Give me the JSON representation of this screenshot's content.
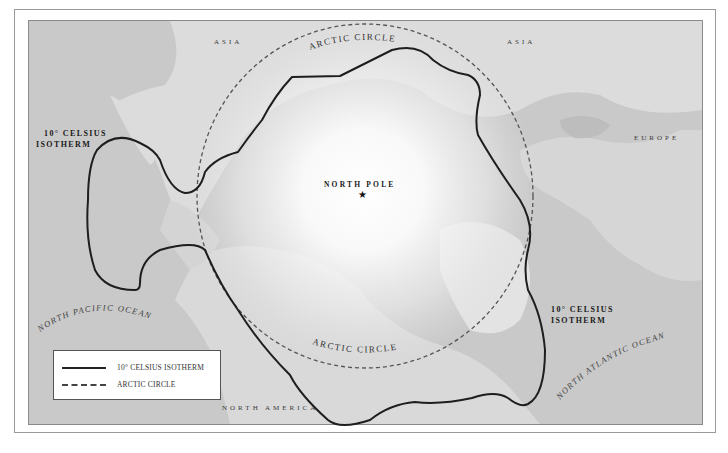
{
  "map": {
    "title": "",
    "colors": {
      "ocean": "#c9c9c9",
      "land": "#dedede",
      "pole_glow": "#ffffff",
      "isotherm_line": "#1e1e1e",
      "arctic_circle_line": "#555555",
      "frame_border": "#9a9a9a"
    },
    "center_marker": {
      "label": "NORTH POLE",
      "icon": "star-icon",
      "glyph": "★"
    },
    "regions": {
      "asia_left": "ASIA",
      "asia_right": "ASIA",
      "europe": "EUROPE",
      "north_america": "NORTH AMERICA"
    },
    "oceans": {
      "north_pacific": "NORTH PACIFIC OCEAN",
      "north_atlantic": "NORTH ATLANTIC OCEAN"
    },
    "line_labels": {
      "arctic_circle_top": "ARCTIC CIRCLE",
      "arctic_circle_bottom": "ARCTIC CIRCLE",
      "isotherm_left_line1": "10° CELSIUS",
      "isotherm_left_line2": "ISOTHERM",
      "isotherm_right_line1": "10° CELSIUS",
      "isotherm_right_line2": "ISOTHERM"
    },
    "legend": {
      "items": [
        {
          "style": "solid",
          "label": "10° CELSIUS ISOTHERM"
        },
        {
          "style": "dashed",
          "label": "ARCTIC CIRCLE"
        }
      ]
    }
  }
}
